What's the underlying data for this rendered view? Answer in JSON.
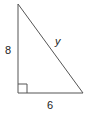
{
  "diagram": {
    "type": "right-triangle",
    "stroke_color": "#555555",
    "text_color": "#222222",
    "vertices": {
      "top": [
        18,
        4
      ],
      "right_angle": [
        18,
        93
      ],
      "bottom_right": [
        83,
        93
      ]
    },
    "labels": {
      "vertical_leg": "8",
      "horizontal_leg": "6",
      "hypotenuse": "y"
    },
    "right_angle_marker": true
  }
}
